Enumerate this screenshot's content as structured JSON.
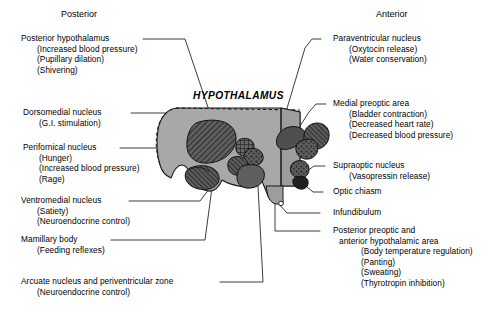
{
  "figure": {
    "organ_title": "HYPOTHALAMUS",
    "orientation": {
      "posterior": "Posterior",
      "anterior": "Anterior"
    },
    "colors": {
      "body_fill": "#a8a8a8",
      "nucleus_fill": "#5a5a5a",
      "outline": "#1a1a1a",
      "background": "#ffffff",
      "text": "#000000"
    }
  },
  "left_labels": [
    {
      "name": "posterior-hypothalamus",
      "main": "Posterior hypothalamus",
      "subs": [
        "(Increased blood pressure)",
        "(Pupillary dilation)",
        "(Shivering)"
      ]
    },
    {
      "name": "dorsomedial-nucleus",
      "main": "Dorsomedial nucleus",
      "subs": [
        "(G.I. stimulation)"
      ]
    },
    {
      "name": "perifornical-nucleus",
      "main": "Perifornical nucleus",
      "subs": [
        "(Hunger)",
        "(Increased blood pressure)",
        "(Rage)"
      ]
    },
    {
      "name": "ventromedial-nucleus",
      "main": "Ventromedial nucleus",
      "subs": [
        "(Satiety)",
        "(Neuroendocrine control)"
      ]
    },
    {
      "name": "mamillary-body",
      "main": "Mamillary body",
      "subs": [
        "(Feeding reflexes)"
      ]
    },
    {
      "name": "arcuate-nucleus-and-periventricular-zone",
      "main": "Arcuate nucleus and periventricular zone",
      "subs": [
        "(Neuroendocrine control)"
      ]
    }
  ],
  "right_labels": [
    {
      "name": "paraventricular-nucleus",
      "main": "Paraventricular nucleus",
      "subs": [
        "(Oxytocin release)",
        "(Water conservation)"
      ]
    },
    {
      "name": "medial-preoptic-area",
      "main": "Medial preoptic area",
      "subs": [
        "(Bladder contraction)",
        "(Decreased heart rate)",
        "(Decreased blood pressure)"
      ]
    },
    {
      "name": "supraoptic-nucleus",
      "main": "Supraoptic nucleus",
      "subs": [
        "(Vasopressin release)"
      ]
    },
    {
      "name": "optic-chiasm",
      "main": "Optic chiasm",
      "subs": []
    },
    {
      "name": "infundibulum",
      "main": "Infundibulum",
      "subs": []
    },
    {
      "name": "posterior-preoptic-and-anterior-hypothalamic-area",
      "main": "Posterior preoptic and",
      "main2": "anterior hypothalamic area",
      "subs": [
        "(Body temperature regulation)",
        "(Panting)",
        "(Sweating)",
        "(Thyrotropin inhibition)"
      ]
    }
  ]
}
